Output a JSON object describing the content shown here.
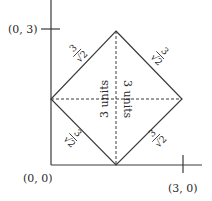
{
  "diagram": {
    "axes": {
      "origin_label": "(0, 0)",
      "y_tick_label": "(0, 3)",
      "x_tick_label": "(3, 0)"
    },
    "edges": {
      "top_left": {
        "numerator": "3",
        "denominator": "√2"
      },
      "top_right": {
        "numerator": "3",
        "denominator": "√2"
      },
      "bottom_left": {
        "numerator": "3",
        "denominator": "√2"
      },
      "bottom_right": {
        "numerator": "3",
        "denominator": "√2"
      }
    },
    "diagonals": {
      "vertical_label": "3 units",
      "horizontal_label": "3 units"
    },
    "colors": {
      "line": "#3a3a3a",
      "background": "#ffffff"
    }
  }
}
